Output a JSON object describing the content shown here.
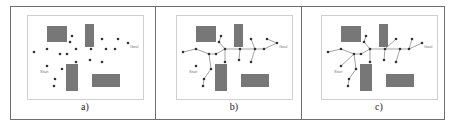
{
  "figure": {
    "panels": [
      {
        "id": "a",
        "caption": "a)",
        "frame_x": 27,
        "show_edges": false
      },
      {
        "id": "b",
        "caption": "b)",
        "frame_x": 176,
        "show_edges": true,
        "edges_key": "b"
      },
      {
        "id": "c",
        "caption": "c)",
        "frame_x": 321,
        "show_edges": true,
        "edges_key": "c"
      }
    ],
    "frame": {
      "y": 15,
      "width": 116,
      "height": 84
    },
    "labels": {
      "start": "Start",
      "goal": "Goal"
    },
    "colors": {
      "obstacle": "#777777",
      "node": "#333333",
      "edge": "#8a8a8a",
      "frame": "#cfcfcf",
      "outer": "#6e6e6e"
    },
    "obstacles": [
      {
        "x": 20,
        "y": 11,
        "w": 20,
        "h": 16
      },
      {
        "x": 58,
        "y": 9,
        "w": 9,
        "h": 23
      },
      {
        "x": 39,
        "y": 49,
        "w": 12,
        "h": 27
      },
      {
        "x": 65,
        "y": 59,
        "w": 28,
        "h": 13
      }
    ],
    "nodes": [
      {
        "id": 0,
        "x": 20,
        "y": 51,
        "role": "start"
      },
      {
        "id": 1,
        "x": 7,
        "y": 37
      },
      {
        "id": 2,
        "x": 20,
        "y": 34
      },
      {
        "id": 3,
        "x": 33,
        "y": 39
      },
      {
        "id": 4,
        "x": 40,
        "y": 39
      },
      {
        "id": 5,
        "x": 45,
        "y": 21
      },
      {
        "id": 6,
        "x": 43,
        "y": 27
      },
      {
        "id": 7,
        "x": 49,
        "y": 34
      },
      {
        "id": 8,
        "x": 49,
        "y": 47
      },
      {
        "id": 9,
        "x": 35,
        "y": 54
      },
      {
        "id": 10,
        "x": 28,
        "y": 64
      },
      {
        "id": 11,
        "x": 27,
        "y": 71
      },
      {
        "id": 12,
        "x": 64,
        "y": 34
      },
      {
        "id": 13,
        "x": 63,
        "y": 45
      },
      {
        "id": 14,
        "x": 75,
        "y": 24
      },
      {
        "id": 15,
        "x": 79,
        "y": 34
      },
      {
        "id": 16,
        "x": 75,
        "y": 47
      },
      {
        "id": 17,
        "x": 88,
        "y": 34
      },
      {
        "id": 18,
        "x": 91,
        "y": 24
      },
      {
        "id": 19,
        "x": 101,
        "y": 28,
        "role": "goal"
      }
    ],
    "edges": {
      "b": [
        [
          1,
          2
        ],
        [
          2,
          3
        ],
        [
          3,
          4
        ],
        [
          4,
          7
        ],
        [
          7,
          6
        ],
        [
          6,
          5
        ],
        [
          7,
          8
        ],
        [
          3,
          9
        ],
        [
          9,
          10
        ],
        [
          10,
          11
        ],
        [
          7,
          12
        ],
        [
          12,
          13
        ],
        [
          12,
          15
        ],
        [
          15,
          14
        ],
        [
          15,
          16
        ],
        [
          15,
          17
        ],
        [
          17,
          19
        ],
        [
          19,
          18
        ]
      ],
      "c": [
        [
          1,
          2
        ],
        [
          2,
          3
        ],
        [
          3,
          4
        ],
        [
          4,
          7
        ],
        [
          7,
          6
        ],
        [
          6,
          5
        ],
        [
          7,
          8
        ],
        [
          3,
          0
        ],
        [
          3,
          9
        ],
        [
          9,
          10
        ],
        [
          10,
          11
        ],
        [
          7,
          12
        ],
        [
          12,
          13
        ],
        [
          12,
          14
        ],
        [
          12,
          15
        ],
        [
          15,
          16
        ],
        [
          15,
          17
        ],
        [
          17,
          19
        ],
        [
          17,
          18
        ]
      ]
    }
  }
}
